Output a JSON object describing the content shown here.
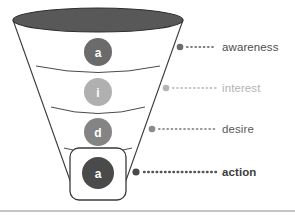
{
  "diagram": {
    "type": "funnel",
    "background_color": "#ffffff",
    "bottom_rule_color": "#8a8a8a",
    "funnel": {
      "outline_color": "#3a3a3a",
      "body_fill": "#ffffff",
      "top_ellipse_fill": "#585858",
      "top_ellipse_stroke": "#2e2e2e",
      "divider_color": "#4a4a4a",
      "highlight_box_stroke": "#3a3a3a"
    },
    "stages": [
      {
        "id": "awareness",
        "letter": "a",
        "label": "awareness",
        "circle_color": "#6b6b6b",
        "marker_color": "#6b6b6b",
        "dot_leader_color": "#7d7d7d",
        "label_color": "#4d4d4d",
        "emphasized": false
      },
      {
        "id": "interest",
        "letter": "i",
        "label": "interest",
        "circle_color": "#b0b0b0",
        "marker_color": "#b4b4b4",
        "dot_leader_color": "#c4c4c4",
        "label_color": "#b4b4b4",
        "emphasized": false
      },
      {
        "id": "desire",
        "letter": "d",
        "label": "desire",
        "circle_color": "#848484",
        "marker_color": "#8a8a8a",
        "dot_leader_color": "#969696",
        "label_color": "#5a5a5a",
        "emphasized": false
      },
      {
        "id": "action",
        "letter": "a",
        "label": "action",
        "circle_color": "#4a4a4a",
        "marker_color": "#4a4a4a",
        "dot_leader_color": "#565656",
        "label_color": "#3b3b3b",
        "emphasized": true
      }
    ]
  }
}
